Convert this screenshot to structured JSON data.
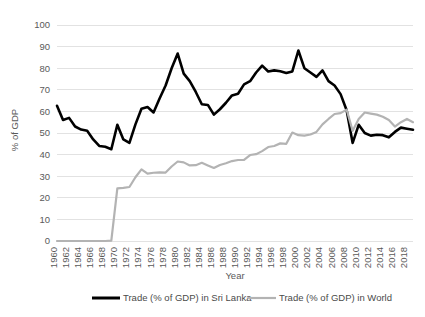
{
  "chart_data": {
    "type": "line",
    "title": "",
    "xlabel": "Year",
    "ylabel": "% of GDP",
    "ylim": [
      0,
      100
    ],
    "ytick_step": 10,
    "yticks": [
      "0",
      "10",
      "20",
      "30",
      "40",
      "50",
      "60",
      "70",
      "80",
      "90",
      "100"
    ],
    "xlim": [
      1960,
      2019
    ],
    "xticks": [
      "1960",
      "1962",
      "1964",
      "1966",
      "1968",
      "1970",
      "1972",
      "1974",
      "1976",
      "1978",
      "1980",
      "1982",
      "1984",
      "1986",
      "1988",
      "1990",
      "1992",
      "1994",
      "1996",
      "1998",
      "2000",
      "2002",
      "2004",
      "2006",
      "2008",
      "2010",
      "2012",
      "2014",
      "2016",
      "2018"
    ],
    "grid": "horizontal",
    "legend_position": "bottom",
    "x": [
      1960,
      1961,
      1962,
      1963,
      1964,
      1965,
      1966,
      1967,
      1968,
      1969,
      1970,
      1971,
      1972,
      1973,
      1974,
      1975,
      1976,
      1977,
      1978,
      1979,
      1980,
      1981,
      1982,
      1983,
      1984,
      1985,
      1986,
      1987,
      1988,
      1989,
      1990,
      1991,
      1992,
      1993,
      1994,
      1995,
      1996,
      1997,
      1998,
      1999,
      2000,
      2001,
      2002,
      2003,
      2004,
      2005,
      2006,
      2007,
      2008,
      2009,
      2010,
      2011,
      2012,
      2013,
      2014,
      2015,
      2016,
      2017,
      2018,
      2019
    ],
    "series": [
      {
        "name": "Trade (% of GDP) in Sri Lanka",
        "color": "#000000",
        "width": 2.6,
        "values": [
          62.6,
          56.0,
          57.0,
          53.0,
          51.6,
          51.0,
          47.0,
          44.0,
          43.6,
          42.5,
          53.8,
          47.0,
          45.4,
          54.0,
          61.2,
          62.0,
          59.5,
          66.0,
          72.0,
          80.0,
          86.8,
          77.5,
          74.0,
          69.0,
          63.3,
          63.0,
          58.5,
          61.0,
          64.0,
          67.4,
          68.2,
          72.5,
          74.0,
          78.0,
          81.2,
          78.5,
          79.0,
          78.6,
          77.8,
          78.5,
          88.2,
          80.0,
          78.0,
          76.0,
          79.0,
          74.0,
          72.0,
          68.0,
          60.5,
          45.4,
          53.8,
          50.0,
          48.8,
          49.2,
          49.0,
          48.0,
          50.5,
          52.5,
          52.0,
          51.5
        ]
      },
      {
        "name": "Trade (% of GDP) in World",
        "color": "#b3b3b3",
        "width": 2.2,
        "values": [
          0,
          0,
          0,
          0,
          0,
          0,
          0,
          0,
          0,
          0.2,
          24.4,
          24.6,
          25.0,
          29.5,
          33.2,
          31.2,
          31.6,
          31.8,
          31.7,
          34.5,
          36.8,
          36.4,
          35.0,
          35.1,
          36.2,
          35.0,
          33.8,
          35.2,
          36.0,
          37.0,
          37.5,
          37.6,
          39.8,
          40.2,
          41.6,
          43.5,
          44.0,
          45.2,
          45.0,
          50.2,
          49.0,
          48.8,
          49.3,
          50.5,
          54.0,
          56.5,
          58.8,
          59.2,
          60.8,
          51.0,
          56.5,
          59.5,
          59.0,
          58.5,
          57.5,
          56.0,
          53.0,
          55.0,
          56.5,
          55.0
        ]
      }
    ]
  },
  "legend": [
    {
      "label": "Trade (% of GDP) in Sri Lanka"
    },
    {
      "label": "Trade (% of GDP) in World"
    }
  ]
}
